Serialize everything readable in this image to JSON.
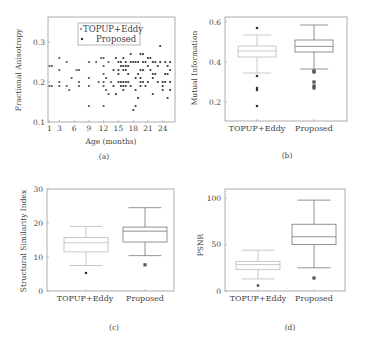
{
  "chart_data": [
    {
      "id": "a",
      "type": "scatter",
      "caption": "(a)",
      "title": "",
      "xlabel": "Age (months)",
      "ylabel": "Fractional Anisotropy",
      "xlim": [
        0.7,
        26.5
      ],
      "ylim": [
        0.1,
        0.3625
      ],
      "xticks": [
        1,
        3,
        6,
        9,
        12,
        15,
        18,
        21,
        24
      ],
      "yticks": [
        0.1,
        0.2,
        0.3
      ],
      "grid": false,
      "legend": {
        "position": "upper center",
        "entries": [
          "TOPUP+Eddy",
          "Proposed"
        ]
      },
      "series": [
        {
          "name": "TOPUP+Eddy",
          "color": "#555555",
          "points": [
            [
              1,
              0.24
            ],
            [
              1.5,
              0.24
            ],
            [
              1,
              0.19
            ],
            [
              1.5,
              0.19
            ],
            [
              3,
              0.26
            ],
            [
              3,
              0.23
            ],
            [
              3,
              0.2
            ],
            [
              3,
              0.19
            ],
            [
              4.5,
              0.25
            ],
            [
              4.5,
              0.19
            ],
            [
              5,
              0.18
            ],
            [
              5.5,
              0.21
            ],
            [
              6.5,
              0.23
            ],
            [
              7,
              0.23
            ],
            [
              7,
              0.2
            ],
            [
              7,
              0.19
            ],
            [
              9,
              0.25
            ],
            [
              9,
              0.21
            ],
            [
              9,
              0.19
            ],
            [
              9,
              0.14
            ],
            [
              10.5,
              0.25
            ],
            [
              11,
              0.2
            ],
            [
              11.5,
              0.26
            ],
            [
              12,
              0.26
            ],
            [
              12,
              0.24
            ],
            [
              12,
              0.22
            ],
            [
              12,
              0.2
            ],
            [
              12,
              0.19
            ],
            [
              12,
              0.14
            ],
            [
              12.5,
              0.21
            ],
            [
              12.5,
              0.18
            ],
            [
              13,
              0.25
            ],
            [
              13,
              0.17
            ],
            [
              13.5,
              0.2
            ]
          ]
        },
        {
          "name": "Proposed",
          "color": "#333333",
          "points": [
            [
              14,
              0.23
            ],
            [
              14,
              0.19
            ],
            [
              14.5,
              0.26
            ],
            [
              14.5,
              0.17
            ],
            [
              15,
              0.25
            ],
            [
              15,
              0.23
            ],
            [
              15,
              0.22
            ],
            [
              15,
              0.2
            ],
            [
              15.5,
              0.25
            ],
            [
              15.5,
              0.24
            ],
            [
              15.5,
              0.2
            ],
            [
              15.5,
              0.19
            ],
            [
              16,
              0.26
            ],
            [
              16,
              0.24
            ],
            [
              16,
              0.23
            ],
            [
              16,
              0.2
            ],
            [
              16,
              0.19
            ],
            [
              16,
              0.18
            ],
            [
              16.5,
              0.25
            ],
            [
              16.5,
              0.24
            ],
            [
              16.5,
              0.23
            ],
            [
              16.5,
              0.2
            ],
            [
              16.5,
              0.19
            ],
            [
              17,
              0.24
            ],
            [
              17,
              0.22
            ],
            [
              17,
              0.2
            ],
            [
              17.5,
              0.27
            ],
            [
              17.5,
              0.25
            ],
            [
              17.5,
              0.19
            ],
            [
              18,
              0.25
            ],
            [
              18,
              0.13
            ],
            [
              18.5,
              0.25
            ],
            [
              18.5,
              0.21
            ],
            [
              18.5,
              0.18
            ],
            [
              18.5,
              0.14
            ],
            [
              19,
              0.25
            ],
            [
              19,
              0.22
            ],
            [
              19,
              0.16
            ],
            [
              19.5,
              0.27
            ],
            [
              19.5,
              0.23
            ],
            [
              19.5,
              0.21
            ],
            [
              19.5,
              0.2
            ],
            [
              19.5,
              0.19
            ],
            [
              20,
              0.27
            ],
            [
              20,
              0.25
            ],
            [
              20,
              0.23
            ],
            [
              20,
              0.2
            ],
            [
              20.5,
              0.25
            ],
            [
              20.5,
              0.19
            ],
            [
              21,
              0.26
            ],
            [
              21,
              0.24
            ],
            [
              21,
              0.2
            ],
            [
              21.5,
              0.26
            ],
            [
              21.5,
              0.23
            ],
            [
              22,
              0.25
            ],
            [
              22,
              0.22
            ],
            [
              22,
              0.21
            ],
            [
              22,
              0.17
            ],
            [
              22.5,
              0.25
            ],
            [
              22.5,
              0.22
            ],
            [
              23,
              0.24
            ],
            [
              23,
              0.2
            ],
            [
              23.5,
              0.29
            ],
            [
              23.5,
              0.25
            ],
            [
              24,
              0.2
            ],
            [
              24,
              0.19
            ],
            [
              24,
              0.18
            ],
            [
              24.5,
              0.25
            ],
            [
              24.5,
              0.22
            ],
            [
              24.5,
              0.2
            ],
            [
              25,
              0.24
            ],
            [
              25,
              0.22
            ],
            [
              25,
              0.16
            ],
            [
              25.5,
              0.25
            ],
            [
              25.5,
              0.23
            ],
            [
              25.5,
              0.2
            ],
            [
              25.5,
              0.18
            ]
          ]
        }
      ]
    },
    {
      "id": "b",
      "type": "box",
      "caption": "(b)",
      "xlabel": "",
      "ylabel": "Mutual Information",
      "categories": [
        "TOPUP+Eddy",
        "Proposed"
      ],
      "ylim": [
        0.105,
        0.625
      ],
      "yticks": [
        0.2,
        0.4,
        0.6
      ],
      "boxes": [
        {
          "name": "TOPUP+Eddy",
          "whislo": 0.345,
          "q1": 0.425,
          "med": 0.455,
          "q3": 0.48,
          "whishi": 0.535,
          "fliers": [
            0.57,
            0.33,
            0.27,
            0.26,
            0.18
          ],
          "color": "#bbbbbb"
        },
        {
          "name": "Proposed",
          "whislo": 0.365,
          "q1": 0.45,
          "med": 0.478,
          "q3": 0.51,
          "whishi": 0.585,
          "fliers": [
            0.355,
            0.35,
            0.3,
            0.28,
            0.27
          ],
          "color": "#777777"
        }
      ]
    },
    {
      "id": "c",
      "type": "box",
      "caption": "(c)",
      "xlabel": "",
      "ylabel": "Structural Similarity Index",
      "categories": [
        "TOPUP+Eddy",
        "Proposed"
      ],
      "ylim": [
        0,
        30
      ],
      "yticks": [
        0,
        10,
        20,
        30
      ],
      "boxes": [
        {
          "name": "TOPUP+Eddy",
          "whislo": 7.5,
          "q1": 11.5,
          "med": 14.2,
          "q3": 15.7,
          "whishi": 19.0,
          "fliers": [
            5.3
          ],
          "color": "#bbbbbb"
        },
        {
          "name": "Proposed",
          "whislo": 10.4,
          "q1": 14.4,
          "med": 17.6,
          "q3": 18.8,
          "whishi": 24.5,
          "fliers": [
            7.7
          ],
          "color": "#777777"
        }
      ]
    },
    {
      "id": "d",
      "type": "box",
      "caption": "(d)",
      "xlabel": "",
      "ylabel": "PSNR",
      "categories": [
        "TOPUP+Eddy",
        "Proposed"
      ],
      "ylim": [
        0,
        110
      ],
      "yticks": [
        0,
        50,
        100
      ],
      "boxes": [
        {
          "name": "TOPUP+Eddy",
          "whislo": 13,
          "q1": 23,
          "med": 28.5,
          "q3": 32,
          "whishi": 44,
          "fliers": [
            6
          ],
          "color": "#bbbbbb"
        },
        {
          "name": "Proposed",
          "whislo": 25,
          "q1": 50,
          "med": 58.5,
          "q3": 72,
          "whishi": 98,
          "fliers": [
            14
          ],
          "color": "#777777"
        }
      ]
    }
  ],
  "captions": {
    "a": "(a)",
    "b": "(b)",
    "c": "(c)",
    "d": "(d)"
  },
  "labels": {
    "a_xlabel": "Age (months)",
    "a_ylabel": "Fractional Anisotropy",
    "b_ylabel": "Mutual Information",
    "c_ylabel": "Structural Similarity Index",
    "d_ylabel": "PSNR",
    "cat1": "TOPUP+Eddy",
    "cat2": "Proposed",
    "legend1": "TOPUP+Eddy",
    "legend2": "Proposed"
  }
}
